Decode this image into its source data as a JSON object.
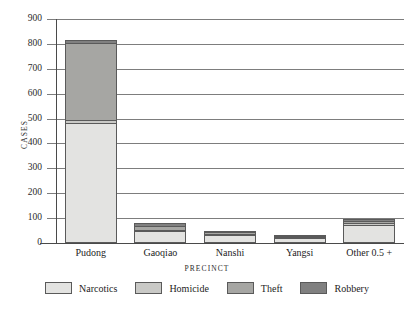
{
  "chart_data": {
    "type": "bar",
    "stacked": true,
    "title": "",
    "xlabel": "PRECINCT",
    "ylabel": "CASES",
    "categories": [
      "Pudong",
      "Gaoqiao",
      "Nanshi",
      "Yangsi",
      "Other 0.5 +"
    ],
    "series": [
      {
        "name": "Narcotics",
        "color": "#e3e3e1",
        "values": [
          480,
          45,
          28,
          22,
          72
        ]
      },
      {
        "name": "Homicide",
        "color": "#c9c9c6",
        "values": [
          12,
          6,
          5,
          3,
          6
        ]
      },
      {
        "name": "Theft",
        "color": "#a6a6a3",
        "values": [
          310,
          18,
          12,
          4,
          10
        ]
      },
      {
        "name": "Robbery",
        "color": "#808080",
        "values": [
          13,
          11,
          5,
          2,
          7
        ]
      }
    ],
    "totals": [
      815,
      80,
      50,
      31,
      95
    ],
    "ylim": [
      0,
      900
    ],
    "yticks": [
      0,
      100,
      200,
      300,
      400,
      500,
      600,
      700,
      800,
      900
    ],
    "ytick_labels": [
      "0",
      "100",
      "200",
      "300",
      "400",
      "500",
      "600",
      "700",
      "800",
      "900"
    ],
    "grid": true,
    "legend_position": "bottom"
  },
  "axis": {
    "y_title": "CASES",
    "x_title": "PRECINCT"
  }
}
